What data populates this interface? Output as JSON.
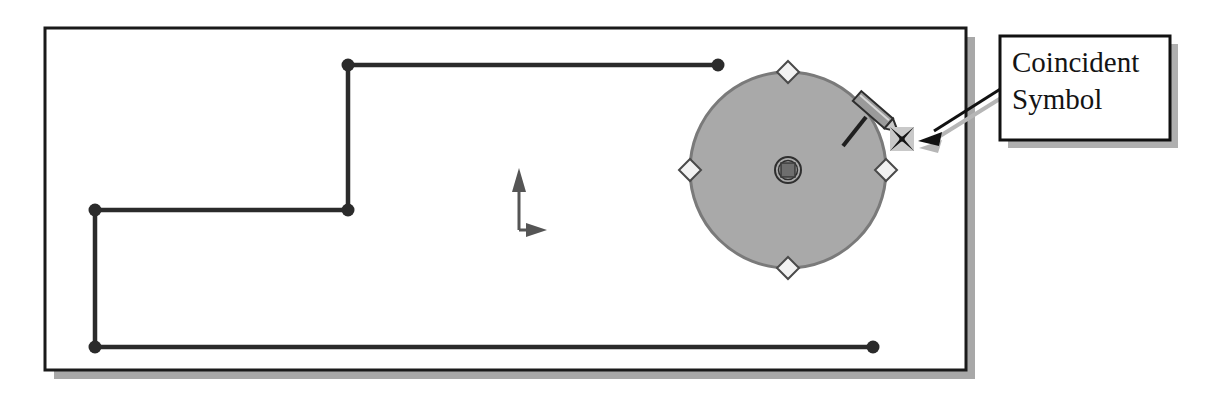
{
  "figure": {
    "name": "sketch-coincident-relation-figure",
    "background": "#ffffff"
  },
  "sketch_frame": {
    "name": "sketch-viewport-frame",
    "x": 45,
    "y": 28,
    "width": 921,
    "height": 342,
    "border_color": "#1a1a1a",
    "fill": "#ffffff",
    "shadow_color": "#a8a8a8",
    "shadow_offset": 9
  },
  "origin_marker": {
    "name": "sketch-origin-axes",
    "x": 518,
    "y": 172,
    "vertical_arrow_label": "Y",
    "horizontal_arrow_label": "X",
    "color": "#555555"
  },
  "polyline": {
    "name": "sketch-polyline",
    "color": "#2b2b2b",
    "stroke_width": 4,
    "endpoint_color": "#2b2b2b",
    "endpoint_radius": 6,
    "points": [
      {
        "label": "p1-top-right-end",
        "x": 718,
        "y": 65,
        "endpoint": true
      },
      {
        "label": "p2-top-left-corner",
        "x": 348,
        "y": 65,
        "endpoint": true
      },
      {
        "label": "p3-mid-corner",
        "x": 348,
        "y": 210,
        "endpoint": true
      },
      {
        "label": "p4-left-corner",
        "x": 95,
        "y": 210,
        "endpoint": true
      },
      {
        "label": "p5-bottom-left-corner",
        "x": 95,
        "y": 347,
        "endpoint": true
      },
      {
        "label": "p6-bottom-right-end",
        "x": 873,
        "y": 347,
        "endpoint": true
      }
    ]
  },
  "circle": {
    "name": "sketch-circle",
    "center_x": 788,
    "center_y": 170,
    "radius": 98,
    "fill": "#a9a9a9",
    "stroke": "#7a7a7a",
    "stroke_width": 3,
    "handles": [
      {
        "label": "handle-top",
        "x": 788,
        "y": 72
      },
      {
        "label": "handle-right",
        "x": 886,
        "y": 170
      },
      {
        "label": "handle-bottom",
        "x": 788,
        "y": 268
      },
      {
        "label": "handle-left",
        "x": 690,
        "y": 170
      }
    ],
    "handle_fill": "#f2f2f2",
    "handle_stroke": "#4a4a4a",
    "handle_size": 9,
    "center_marker": {
      "label": "circle-center-point",
      "outer_stroke": "#333333",
      "inner_fill": "#6e6e6e"
    }
  },
  "pencil_cursor": {
    "name": "pencil-cursor-icon",
    "x": 862,
    "y": 100,
    "body_fill": "#9a9a9a",
    "outline": "#2e2e2e",
    "trail_color": "#1f1f1f"
  },
  "coincident_symbol": {
    "name": "coincident-relation-symbol",
    "x": 890,
    "y": 127,
    "size": 24,
    "background": "#c9c9c9",
    "glyph_color": "#161616",
    "tooltip": "Coincident Symbol"
  },
  "leader_arrow": {
    "name": "callout-leader-arrow",
    "from_x": 1002,
    "from_y": 88,
    "to_x": 921,
    "to_y": 133,
    "color": "#111111",
    "shadow_color": "#b6b6b6",
    "stroke_width": 3
  },
  "callout": {
    "name": "callout-label-box",
    "x": 1000,
    "y": 36,
    "width": 170,
    "height": 104,
    "border_color": "#111111",
    "border_width": 3,
    "fill": "#ffffff",
    "shadow_color": "#b0b0b0",
    "shadow_offset": 8,
    "text": "Coincident\nSymbol",
    "lines": [
      "Coincident",
      "Symbol"
    ]
  }
}
